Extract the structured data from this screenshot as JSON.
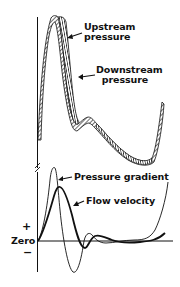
{
  "diagram": {
    "top_panel": {
      "labels": {
        "upstream": [
          "Upstream",
          "pressure"
        ],
        "downstream": [
          "Downstream",
          "pressure"
        ]
      }
    },
    "bottom_panel": {
      "labels": {
        "pressure_gradient": "Pressure gradient",
        "flow_velocity": "Flow velocity"
      },
      "axis": {
        "plus": "+",
        "zero": "Zero",
        "minus": "−"
      }
    },
    "colors": {
      "ink": "#111111",
      "background": "#ffffff"
    }
  }
}
